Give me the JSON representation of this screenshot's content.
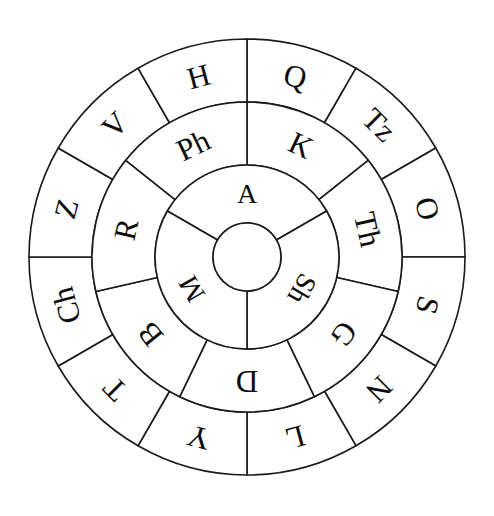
{
  "diagram": {
    "type": "concentric-ring-wheel",
    "background_color": "#ffffff",
    "stroke_color": "#1a1a1a",
    "text_color": "#0d0d0d",
    "geometry": {
      "center_x": 247,
      "center_y": 257,
      "radius_outer": 218,
      "radius_outer_inner_edge": 155,
      "radius_middle_inner_edge": 92,
      "radius_inner_inner_edge": 34,
      "outer_label_radius": 187,
      "middle_label_radius": 124,
      "inner_label_radius": 64
    },
    "rings": [
      {
        "name": "outer-ring",
        "sector_count": 12,
        "sector_span_degrees": 30,
        "start_angle_degrees": -90,
        "sectors": [
          {
            "label": "Q",
            "start": -90,
            "end": -60
          },
          {
            "label": "Tz",
            "start": -60,
            "end": -30
          },
          {
            "label": "O",
            "start": -30,
            "end": 0
          },
          {
            "label": "S",
            "start": 0,
            "end": 30
          },
          {
            "label": "N",
            "start": 30,
            "end": 60
          },
          {
            "label": "L",
            "start": 60,
            "end": 90
          },
          {
            "label": "Y",
            "start": 90,
            "end": 120
          },
          {
            "label": "T",
            "start": 120,
            "end": 150
          },
          {
            "label": "Ch",
            "start": 150,
            "end": 180
          },
          {
            "label": "Z",
            "start": 180,
            "end": 210
          },
          {
            "label": "V",
            "start": 210,
            "end": 240
          },
          {
            "label": "H",
            "start": 240,
            "end": 270
          }
        ]
      },
      {
        "name": "middle-ring",
        "sector_count": 7,
        "sector_span_degrees": 51.4286,
        "start_angle_degrees": -90,
        "sectors": [
          {
            "label": "K",
            "start": -90.0,
            "end": -38.57
          },
          {
            "label": "Th",
            "start": -38.57,
            "end": 12.86
          },
          {
            "label": "G",
            "start": 12.86,
            "end": 64.29
          },
          {
            "label": "D",
            "start": 64.29,
            "end": 115.71
          },
          {
            "label": "B",
            "start": 115.71,
            "end": 167.14
          },
          {
            "label": "R",
            "start": 167.14,
            "end": 218.57
          },
          {
            "label": "Ph",
            "start": 218.57,
            "end": 270.0
          }
        ]
      },
      {
        "name": "inner-ring",
        "sector_count": 3,
        "sector_span_degrees": 120,
        "start_angle_degrees": -150,
        "sectors": [
          {
            "label": "A",
            "start": -150,
            "end": -30
          },
          {
            "label": "Sh",
            "start": -30,
            "end": 90
          },
          {
            "label": "M",
            "start": 90,
            "end": 210
          }
        ]
      }
    ],
    "hub": {
      "name": "center-hub",
      "label": ""
    },
    "all_letters": [
      "A",
      "Sh",
      "M",
      "K",
      "Th",
      "G",
      "D",
      "B",
      "R",
      "Ph",
      "Q",
      "Tz",
      "O",
      "S",
      "N",
      "L",
      "Y",
      "T",
      "Ch",
      "Z",
      "V",
      "H"
    ]
  }
}
